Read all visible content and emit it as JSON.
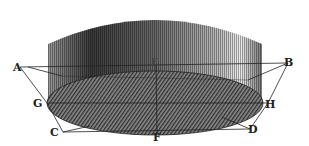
{
  "diagram": {
    "labels": [
      {
        "id": "A",
        "text": "A",
        "x": 13,
        "y": 62
      },
      {
        "id": "B",
        "text": "B",
        "x": 284,
        "y": 57
      },
      {
        "id": "C",
        "text": "C",
        "x": 50,
        "y": 127
      },
      {
        "id": "D",
        "text": "D",
        "x": 248,
        "y": 124
      },
      {
        "id": "E",
        "text": "E",
        "x": 151,
        "y": 58
      },
      {
        "id": "F",
        "text": "F",
        "x": 153,
        "y": 132
      },
      {
        "id": "G",
        "text": "G",
        "x": 33,
        "y": 98
      },
      {
        "id": "H",
        "text": "H",
        "x": 265,
        "y": 99
      }
    ],
    "colors": {
      "ink": "#222222",
      "shade_dark": "#3a3a3a",
      "shade_mid": "#7a7a7a",
      "shade_light": "#d8d8d8",
      "paper": "#ffffff"
    }
  }
}
